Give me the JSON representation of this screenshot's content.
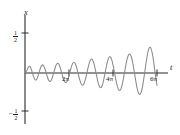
{
  "figure": {
    "kind": "line-plot",
    "background_color": "#ffffff",
    "axis_color": "#2b2b2b",
    "curve_color": "#8a8a8a"
  },
  "axes": {
    "y": {
      "label": "x",
      "ticks": [
        {
          "name": "y-tick-positive-half",
          "value": 0.5,
          "numerator": "1",
          "denominator": "2",
          "sign": ""
        },
        {
          "name": "y-tick-negative-half",
          "value": -0.5,
          "numerator": "1",
          "denominator": "2",
          "sign": "−"
        }
      ],
      "range": [
        -0.62,
        0.62
      ]
    },
    "x": {
      "label": "t",
      "ticks": [
        {
          "name": "x-tick-2pi",
          "label": "2π",
          "value": 6.2832
        },
        {
          "name": "x-tick-4pi",
          "label": "4π",
          "value": 12.5664
        },
        {
          "name": "x-tick-6pi",
          "label": "6π",
          "value": 18.8496
        }
      ],
      "range": [
        0,
        20.4
      ]
    }
  },
  "chart_data": {
    "type": "line",
    "title": "",
    "xlabel": "t",
    "ylabel": "x",
    "xlim": [
      0,
      20.4
    ],
    "ylim": [
      -0.62,
      0.62
    ],
    "grid": false,
    "legend": null,
    "series": [
      {
        "name": "x(t)",
        "color": "#8a8a8a",
        "formula": "0.5 * sin(0.2143 t) * sin(2.357 t)",
        "x": [
          0.0,
          0.2,
          0.4,
          0.6,
          0.8,
          1.0,
          1.2,
          1.4,
          1.6,
          1.8,
          2.0,
          2.2,
          2.4,
          2.6,
          2.8,
          3.0,
          3.2,
          3.4,
          3.6,
          3.8,
          4.0,
          4.2,
          4.4,
          4.6,
          4.8,
          5.0,
          5.2,
          5.4,
          5.6,
          5.8,
          6.0,
          6.2,
          6.4,
          6.6,
          6.8,
          7.0,
          7.2,
          7.4,
          7.6,
          7.8,
          8.0,
          8.2,
          8.4,
          8.6,
          8.8,
          9.0,
          9.2,
          9.4,
          9.6,
          9.8,
          10.0,
          10.2,
          10.4,
          10.6,
          10.8,
          11.0,
          11.2,
          11.4,
          11.6,
          11.8,
          12.0,
          12.2,
          12.4,
          12.6,
          12.8,
          13.0,
          13.2,
          13.4,
          13.6,
          13.8,
          14.0,
          14.2,
          14.4,
          14.6,
          14.8,
          15.0,
          15.2,
          15.4,
          15.6,
          15.8,
          16.0,
          16.2,
          16.4,
          16.6,
          16.8,
          17.0,
          17.2,
          17.4,
          17.6,
          17.8,
          18.0,
          18.2,
          18.4,
          18.6,
          18.8496
        ],
        "y": [
          0.0,
          0.019,
          0.059,
          0.083,
          0.069,
          0.021,
          -0.039,
          -0.081,
          -0.086,
          -0.053,
          0.003,
          0.059,
          0.095,
          0.098,
          0.066,
          0.01,
          -0.05,
          -0.093,
          -0.105,
          -0.081,
          -0.029,
          0.035,
          0.09,
          0.12,
          0.114,
          0.075,
          0.014,
          -0.05,
          -0.1,
          -0.12,
          -0.105,
          -0.059,
          0.005,
          0.07,
          0.118,
          0.134,
          0.113,
          0.06,
          -0.01,
          -0.08,
          -0.133,
          -0.154,
          -0.138,
          -0.087,
          -0.015,
          0.063,
          0.13,
          0.17,
          0.171,
          0.132,
          0.062,
          -0.024,
          -0.105,
          -0.163,
          -0.184,
          -0.162,
          -0.101,
          -0.016,
          0.075,
          0.15,
          0.196,
          0.2,
          0.162,
          0.089,
          -0.003,
          -0.095,
          -0.17,
          -0.213,
          -0.215,
          -0.173,
          -0.096,
          0.001,
          0.098,
          0.18,
          0.229,
          0.236,
          0.197,
          0.12,
          0.018,
          -0.09,
          -0.186,
          -0.25,
          -0.268,
          -0.237,
          -0.16,
          -0.05,
          0.073,
          0.19,
          0.28,
          0.32,
          0.305,
          0.236,
          0.124,
          -0.013,
          -0.155
        ]
      }
    ]
  }
}
